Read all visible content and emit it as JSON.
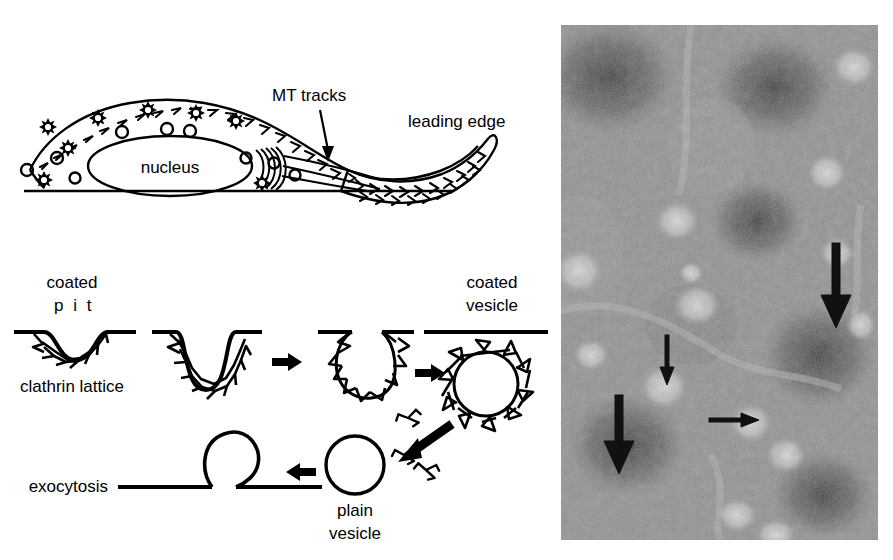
{
  "figure": {
    "background_color": "#ffffff",
    "ink_color": "#000000",
    "width": 893,
    "height": 560
  },
  "panels": [
    {
      "id": "cell-diagram",
      "name": "migrating-cell-schematic",
      "description": "Side view of a motile cell showing nucleus, coated and plain vesicles, microtubule tracks and the leading edge lamellipodium"
    },
    {
      "id": "endocytosis-cycle",
      "name": "clathrin-coated-vesicle-cycle",
      "description": "Sequence from coated pit through endocytosis to coated vesicle, uncoating to plain vesicle and exocytosis"
    },
    {
      "id": "micrograph",
      "name": "negative-stain-electron-micrograph",
      "description": "Grainy negative stain electron micrograph of coated vesicles marked by four arrows"
    }
  ],
  "cell_diagram": {
    "labels": {
      "nucleus": "nucleus",
      "mt_tracks": "MT  tracks",
      "leading_edge": "leading  edge"
    },
    "features": {
      "coated_vesicle_count": 8,
      "plain_vesicle_count": 9,
      "golgi_arc_count": 5,
      "mt_track_count": 3
    }
  },
  "endocytosis_diagram": {
    "labels": {
      "coated": "coated",
      "pit": "p i t",
      "clathrin_lattice": "clathrin  lattice",
      "endocytosis": "endocytosis",
      "coated_vesicle_line1": "coated",
      "coated_vesicle_line2": "vesicle",
      "exocytosis": "exocytosis",
      "plain_line1": "plain",
      "plain_line2": "vesicle"
    },
    "stages": [
      "coated pit",
      "deepening pit",
      "budding vesicle",
      "coated vesicle",
      "uncoating / free triskelions",
      "plain vesicle",
      "exocytosis"
    ],
    "arrow_count": 4,
    "free_triskelion_count": 3
  },
  "micrograph": {
    "arrows": [
      {
        "name": "arrow-large-upper-right",
        "size": "large",
        "direction": "down"
      },
      {
        "name": "arrow-small-upper-left",
        "size": "small",
        "direction": "down"
      },
      {
        "name": "arrow-small-middle",
        "size": "small",
        "direction": "right"
      },
      {
        "name": "arrow-large-lower-left",
        "size": "large",
        "direction": "down"
      }
    ],
    "tone": {
      "background": "#8f8f8f",
      "dark_blobs": "#3a3a3a",
      "light_vesicles": "#d8d8d8"
    }
  }
}
